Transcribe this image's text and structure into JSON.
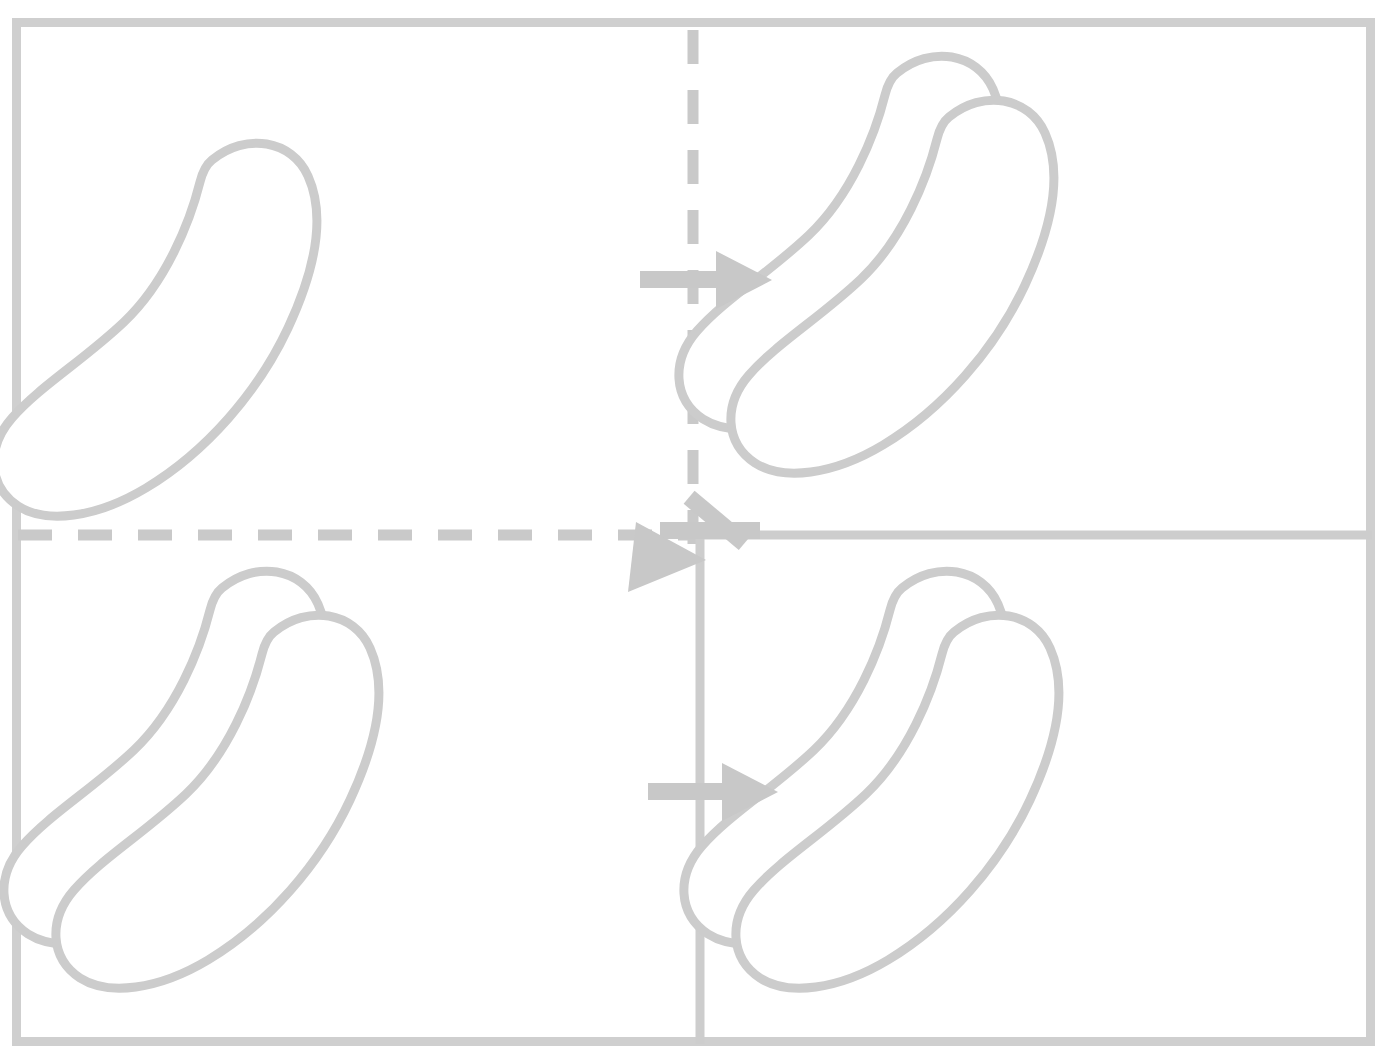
{
  "figure": {
    "type": "diagram",
    "canvas": {
      "width": 1387,
      "height": 1060
    },
    "background_color": "#ffffff"
  },
  "colors": {
    "outer_frame": "#cfcfcf",
    "divider_dashed": "#c9c9c9",
    "divider_solid": "#cdcdcd",
    "arrow": "#c8c8c8",
    "shape_outline": "#cccccc",
    "shape_fill": "#ffffff"
  },
  "frame": {
    "label": "outer-frame",
    "x": 12,
    "y": 18,
    "width": 1363,
    "height": 1028,
    "stroke_width": 9
  },
  "dividers": [
    {
      "name": "vertical-dashed-divider",
      "orientation": "vertical",
      "style": "dashed",
      "x": 693,
      "y1": 30,
      "y2": 560,
      "stroke_width": 11,
      "dash": "34 26"
    },
    {
      "name": "horizontal-dashed-divider",
      "orientation": "horizontal",
      "style": "dashed",
      "y": 535,
      "x1": 18,
      "x2": 700,
      "stroke_width": 11,
      "dash": "34 26"
    },
    {
      "name": "horizontal-solid-divider",
      "orientation": "horizontal",
      "style": "solid",
      "y": 535,
      "x1": 700,
      "x2": 1372,
      "stroke_width": 9
    },
    {
      "name": "vertical-solid-divider",
      "orientation": "vertical",
      "style": "solid",
      "x": 700,
      "y1": 535,
      "y2": 1044,
      "stroke_width": 9
    }
  ],
  "panels": [
    {
      "id": "panel-top-left",
      "name": "panel-top-left",
      "position": "top-left",
      "step": 1,
      "description": "Single banana outline",
      "shape_count": 1,
      "x": 18,
      "y": 24,
      "width": 675,
      "height": 511,
      "shapes": [
        {
          "name": "banana-outline-primary",
          "variant": "upper",
          "offset_x": 0,
          "offset_y": 0
        }
      ]
    },
    {
      "id": "panel-top-right",
      "name": "panel-top-right",
      "position": "top-right",
      "step": 2,
      "description": "Two overlapping banana outlines",
      "shape_count": 2,
      "x": 700,
      "y": 24,
      "width": 672,
      "height": 511,
      "shapes": [
        {
          "name": "banana-outline-back",
          "variant": "upper",
          "offset_x": 0,
          "offset_y": 0
        },
        {
          "name": "banana-outline-front",
          "variant": "lower",
          "offset_x": 0,
          "offset_y": 0
        }
      ]
    },
    {
      "id": "panel-bottom-left",
      "name": "panel-bottom-left",
      "position": "bottom-left",
      "step": 3,
      "description": "Two overlapping banana outlines",
      "shape_count": 2,
      "x": 18,
      "y": 535,
      "width": 682,
      "height": 509,
      "shapes": [
        {
          "name": "banana-outline-back",
          "variant": "upper",
          "offset_x": 0,
          "offset_y": 0
        },
        {
          "name": "banana-outline-front",
          "variant": "lower",
          "offset_x": 0,
          "offset_y": 0
        }
      ]
    },
    {
      "id": "panel-bottom-right",
      "name": "panel-bottom-right",
      "position": "bottom-right",
      "step": 4,
      "description": "Two overlapping banana outlines",
      "shape_count": 2,
      "x": 700,
      "y": 535,
      "width": 672,
      "height": 509,
      "shapes": [
        {
          "name": "banana-outline-back",
          "variant": "upper",
          "offset_x": 0,
          "offset_y": 0
        },
        {
          "name": "banana-outline-front",
          "variant": "lower",
          "offset_x": 0,
          "offset_y": 0
        }
      ]
    }
  ],
  "arrows": [
    {
      "id": "arrow-top-right",
      "name": "arrow-right-top",
      "direction": "right",
      "from_panel": "panel-top-left",
      "to_panel": "panel-top-right",
      "tail_x": 640,
      "tail_y": 280,
      "head_x": 772,
      "head_y": 280,
      "shaft_width": 17,
      "head_length": 52,
      "head_width": 58
    },
    {
      "id": "arrow-diagonal",
      "name": "arrow-down-left-diagonal",
      "direction": "down-left",
      "from_panel": "panel-top-right",
      "to_panel": "panel-bottom-left",
      "tail_x": 736,
      "tail_y": 505,
      "head_x": 628,
      "head_y": 590,
      "shaft_width": 17,
      "head_length": 58,
      "head_width": 62
    },
    {
      "id": "arrow-bottom-right",
      "name": "arrow-right-bottom",
      "direction": "right",
      "from_panel": "panel-bottom-left",
      "to_panel": "panel-bottom-right",
      "tail_x": 648,
      "tail_y": 792,
      "head_x": 778,
      "head_y": 792,
      "shaft_width": 17,
      "head_length": 52,
      "head_width": 58
    }
  ],
  "flow": {
    "name": "transformation-flow",
    "sequence": [
      "panel-top-left",
      "panel-top-right",
      "panel-bottom-left",
      "panel-bottom-right"
    ],
    "step_labels": [
      "1",
      "2",
      "3",
      "4"
    ]
  }
}
